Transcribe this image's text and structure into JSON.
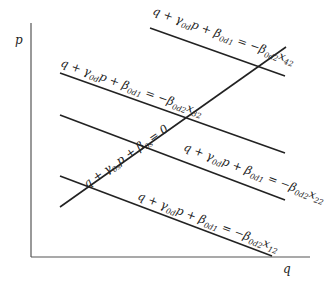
{
  "diagram": {
    "axes": {
      "y_label": "p",
      "x_label": "q"
    },
    "supply_curve": {
      "prefix": "q + γ",
      "sub1": "0s",
      "mid": "p + β",
      "sub2": "0s",
      "suffix": "= 0"
    },
    "demand_curves": [
      {
        "id": "x42",
        "prefix": "q + γ",
        "sub_g": "0d",
        "mid": "p + β",
        "sub_b1": "0d1",
        "eq": " = −β",
        "sub_b2": "0d2",
        "x": "x",
        "sub_x": "42"
      },
      {
        "id": "x32",
        "prefix": "q + γ",
        "sub_g": "0d",
        "mid": "p + β",
        "sub_b1": "0d1",
        "eq": " = −β",
        "sub_b2": "0d2",
        "x": "x",
        "sub_x": "32"
      },
      {
        "id": "x22",
        "prefix": "q + γ",
        "sub_g": "0d",
        "mid": "p + β",
        "sub_b1": "0d1",
        "eq": " = −β",
        "sub_b2": "0d2",
        "x": "x",
        "sub_x": "22"
      },
      {
        "id": "x12",
        "prefix": "q + γ",
        "sub_g": "0d",
        "mid": "p + β",
        "sub_b1": "0d1",
        "eq": " = −β",
        "sub_b2": "0d2",
        "x": "x",
        "sub_x": "12"
      }
    ]
  }
}
